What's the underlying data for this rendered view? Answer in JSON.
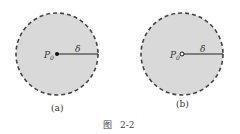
{
  "figure": {
    "caption_prefix": "图",
    "caption_number": "2-2",
    "panels": [
      {
        "id": "a",
        "label": "(a)",
        "point_label": "P",
        "point_subscript": "0",
        "radius_label": "δ",
        "center_marker": "filled-dot"
      },
      {
        "id": "b",
        "label": "(b)",
        "point_label": "P",
        "point_subscript": "0",
        "radius_label": "δ",
        "center_marker": "hollow-dot"
      }
    ],
    "colors": {
      "disk_fill": "#d9d9d9",
      "boundary": "#444444",
      "ink": "#222222"
    }
  }
}
